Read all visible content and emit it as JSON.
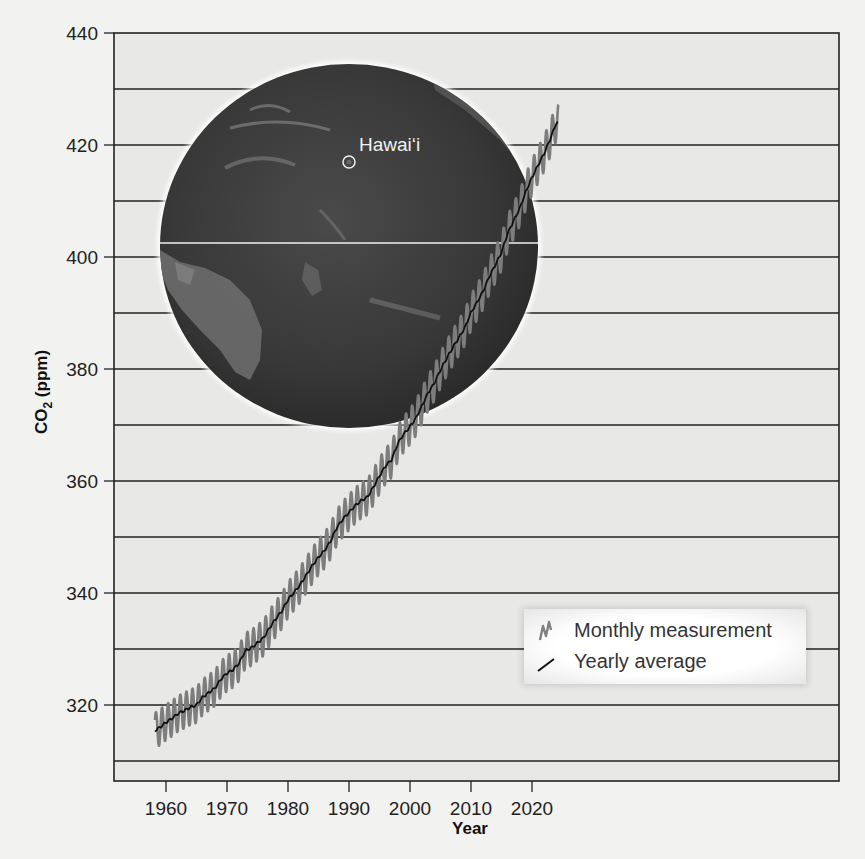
{
  "chart_data": {
    "type": "line",
    "title": "",
    "xlabel": "Year",
    "ylabel": "CO2 (ppm)",
    "ylabel_main": "CO",
    "ylabel_sub": "2",
    "ylabel_unit": " (ppm)",
    "xlim": [
      1955,
      2027
    ],
    "ylim": [
      305,
      440
    ],
    "x_ticks": [
      1960,
      1970,
      1980,
      1990,
      2000,
      2010,
      2020
    ],
    "y_ticks": [
      320,
      340,
      360,
      380,
      400,
      420,
      440
    ],
    "y_minor_gridlines": [
      310,
      330,
      350,
      370,
      390,
      410,
      430
    ],
    "grid": "horizontal",
    "legend_position": "lower right",
    "series": [
      {
        "name": "Monthly measurement",
        "style": "gray seasonal oscillation, amplitude ~±3 ppm around yearly average",
        "color": "#7a7a7a",
        "seasonal_amplitude_ppm": 3.2
      },
      {
        "name": "Yearly average",
        "color": "#111111",
        "x": [
          1958,
          1959,
          1960,
          1961,
          1962,
          1963,
          1964,
          1965,
          1966,
          1967,
          1968,
          1969,
          1970,
          1971,
          1972,
          1973,
          1974,
          1975,
          1976,
          1977,
          1978,
          1979,
          1980,
          1981,
          1982,
          1983,
          1984,
          1985,
          1986,
          1987,
          1988,
          1989,
          1990,
          1991,
          1992,
          1993,
          1994,
          1995,
          1996,
          1997,
          1998,
          1999,
          2000,
          2001,
          2002,
          2003,
          2004,
          2005,
          2006,
          2007,
          2008,
          2009,
          2010,
          2011,
          2012,
          2013,
          2014,
          2015,
          2016,
          2017,
          2018,
          2019,
          2020,
          2021,
          2022,
          2023,
          2024
        ],
        "values": [
          315.3,
          316.0,
          316.9,
          317.6,
          318.5,
          319.0,
          319.6,
          320.0,
          321.4,
          322.2,
          323.0,
          324.6,
          325.7,
          326.3,
          327.5,
          329.7,
          330.2,
          331.1,
          332.0,
          333.8,
          335.4,
          336.8,
          338.8,
          340.1,
          341.5,
          343.2,
          344.9,
          346.4,
          347.6,
          349.3,
          351.7,
          353.2,
          354.4,
          355.6,
          356.5,
          357.1,
          358.9,
          360.9,
          362.7,
          363.8,
          366.7,
          368.4,
          369.7,
          371.3,
          373.5,
          375.8,
          377.5,
          379.8,
          381.9,
          383.8,
          385.6,
          387.4,
          390.1,
          391.9,
          393.9,
          396.5,
          398.6,
          400.8,
          404.2,
          406.5,
          408.7,
          411.7,
          414.2,
          416.4,
          418.5,
          421.1,
          424.0
        ]
      }
    ],
    "annotations": [
      {
        "text": "Hawaiʻi",
        "type": "inset globe location marker"
      }
    ]
  },
  "axes": {
    "y_tick_labels": [
      "440",
      "420",
      "400",
      "380",
      "360",
      "340",
      "320"
    ],
    "x_tick_labels": [
      "1960",
      "1970",
      "1980",
      "1990",
      "2000",
      "2010",
      "2020"
    ]
  },
  "legend": {
    "monthly_label": "Monthly measurement",
    "yearly_label": "Yearly average"
  },
  "inset": {
    "location_label": "Hawaiʻi"
  },
  "caption": {
    "text": "(d) The variation in CO₂ concentration ... through 2023"
  }
}
